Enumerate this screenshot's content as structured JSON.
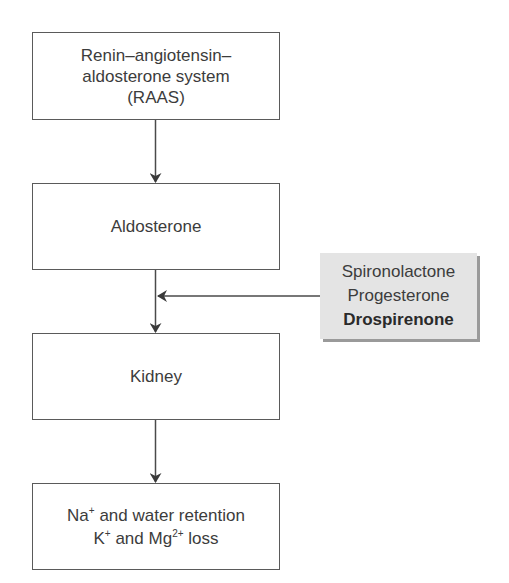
{
  "diagram": {
    "nodes": [
      {
        "id": "raas",
        "lines": [
          "Renin–angiotensin–",
          "aldosterone system",
          "(RAAS)"
        ]
      },
      {
        "id": "aldosterone",
        "lines": [
          "Aldosterone"
        ]
      },
      {
        "id": "kidney",
        "lines": [
          "Kidney"
        ]
      },
      {
        "id": "effects",
        "line1": {
          "a": "Na",
          "a_sup": "+",
          "b": " and water retention"
        },
        "line2": {
          "a": "K",
          "a_sup": "+",
          "b": " and Mg",
          "b_sup": "2+",
          "c": " loss"
        }
      }
    ],
    "inhibitors": {
      "items": [
        "Spironolactone",
        "Progesterone",
        "Drospirenone"
      ],
      "highlighted": "Drospirenone",
      "fill_color": "#e4e4e4"
    },
    "edges": [
      {
        "from": "raas",
        "to": "aldosterone"
      },
      {
        "from": "aldosterone",
        "to": "kidney"
      },
      {
        "from": "inhibitors",
        "to": "aldosterone-kidney-edge"
      },
      {
        "from": "kidney",
        "to": "effects"
      }
    ],
    "line_color": "#4a4a4a"
  }
}
